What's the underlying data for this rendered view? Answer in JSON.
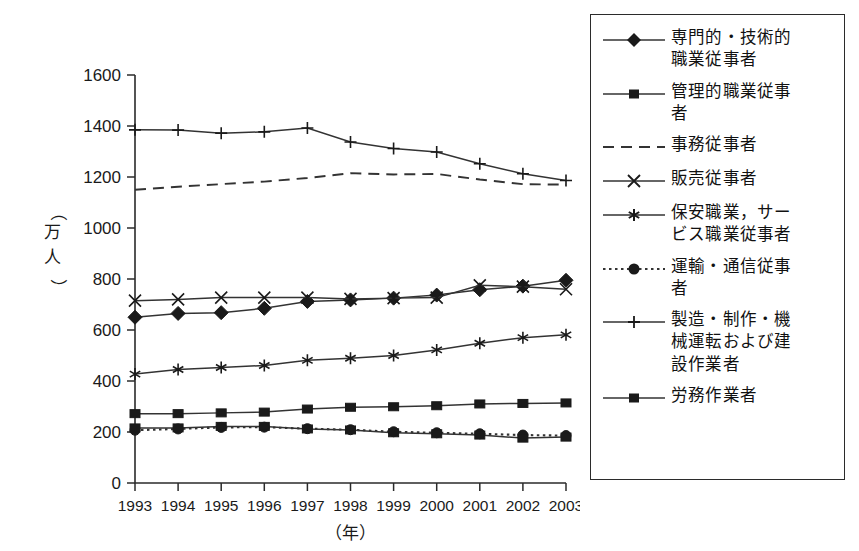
{
  "chart_data": {
    "type": "line",
    "title": "",
    "xlabel": "（年）",
    "ylabel": "（万人）",
    "x": [
      1993,
      1994,
      1995,
      1996,
      1997,
      1998,
      1999,
      2000,
      2001,
      2002,
      2003
    ],
    "xtick_labels": [
      "1993",
      "1994",
      "1995",
      "1996",
      "1997",
      "1998",
      "1999",
      "2000",
      "2001",
      "2002",
      "2003"
    ],
    "ytick_labels": [
      "0",
      "200",
      "400",
      "600",
      "800",
      "1000",
      "1200",
      "1400",
      "1600"
    ],
    "yticks": [
      0,
      200,
      400,
      600,
      800,
      1000,
      1200,
      1400,
      1600
    ],
    "ylim": [
      0,
      1600
    ],
    "xlim": [
      1993,
      2003
    ],
    "grid": false,
    "legend_position": "right",
    "series": [
      {
        "name": "専門的・技術的職業従事者",
        "marker": "diamond",
        "linestyle": "solid",
        "values": [
          650,
          665,
          668,
          685,
          712,
          718,
          725,
          737,
          758,
          772,
          795
        ]
      },
      {
        "name": "管理的職業従事者",
        "marker": "square",
        "linestyle": "solid",
        "values": [
          272,
          272,
          275,
          278,
          290,
          297,
          299,
          303,
          310,
          312,
          314
        ]
      },
      {
        "name": "事務従事者",
        "marker": "none",
        "linestyle": "dashed",
        "values": [
          1150,
          1162,
          1172,
          1182,
          1196,
          1215,
          1210,
          1212,
          1190,
          1172,
          1170
        ]
      },
      {
        "name": "販売従事者",
        "marker": "cross",
        "linestyle": "solid",
        "values": [
          715,
          720,
          727,
          727,
          727,
          722,
          725,
          727,
          775,
          770,
          760
        ]
      },
      {
        "name": "保安職業，サービス職業従事者",
        "marker": "asterisk",
        "linestyle": "solid",
        "values": [
          427,
          445,
          453,
          461,
          481,
          489,
          500,
          522,
          548,
          570,
          581
        ]
      },
      {
        "name": "運輸・通信従事者",
        "marker": "circle",
        "linestyle": "dotted",
        "values": [
          207,
          212,
          218,
          219,
          213,
          209,
          201,
          197,
          193,
          188,
          186
        ]
      },
      {
        "name": "製造・制作・機械運転および建設作業者",
        "marker": "plus",
        "linestyle": "solid",
        "values": [
          1385,
          1384,
          1372,
          1377,
          1392,
          1337,
          1312,
          1298,
          1252,
          1213,
          1186
        ]
      },
      {
        "name": "労務作業者",
        "marker": "square",
        "linestyle": "solid",
        "values": [
          216,
          216,
          222,
          222,
          212,
          208,
          197,
          193,
          188,
          176,
          180
        ]
      }
    ]
  },
  "legend": {
    "items": [
      {
        "label": "専門的・技術的\n職業従事者",
        "marker": "diamond",
        "linestyle": "solid"
      },
      {
        "label": "管理的職業従事\n者",
        "marker": "square",
        "linestyle": "solid"
      },
      {
        "label": "事務従事者",
        "marker": "none",
        "linestyle": "dashed"
      },
      {
        "label": "販売従事者",
        "marker": "cross",
        "linestyle": "solid"
      },
      {
        "label": "保安職業，サー\nビス職業従事者",
        "marker": "asterisk",
        "linestyle": "solid"
      },
      {
        "label": "運輸・通信従事\n者",
        "marker": "circle",
        "linestyle": "dotted"
      },
      {
        "label": "製造・制作・機\n械運転および建\n設作業者",
        "marker": "plus",
        "linestyle": "solid"
      },
      {
        "label": "労務作業者",
        "marker": "square",
        "linestyle": "solid"
      }
    ]
  },
  "colors": {
    "line": "#333333",
    "axis": "#2b2b2b",
    "text": "#1a1a1a",
    "background": "#ffffff"
  }
}
